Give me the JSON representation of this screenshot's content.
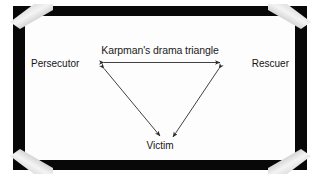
{
  "figure": {
    "title": "Karpman's drama triangle",
    "nodes": [
      {
        "id": "persecutor",
        "label": "Persecutor"
      },
      {
        "id": "rescuer",
        "label": "Rescuer"
      },
      {
        "id": "victim",
        "label": "Victim"
      }
    ],
    "edges": [
      {
        "from": "persecutor",
        "to": "rescuer",
        "arrows": "both"
      },
      {
        "from": "persecutor",
        "to": "victim",
        "arrows": "both"
      },
      {
        "from": "rescuer",
        "to": "victim",
        "arrows": "both"
      }
    ],
    "corner_mounts": [
      "top-left-photo-corner",
      "top-right-photo-corner",
      "bottom-left-photo-corner",
      "bottom-right-photo-corner"
    ],
    "colors": {
      "frame": "#080808",
      "canvas": "#fdfdfd",
      "text": "#151515",
      "arrow": "#2b2b2b",
      "corner_light": "#f2f2f2",
      "corner_shadow": "#9a9a9a"
    }
  }
}
